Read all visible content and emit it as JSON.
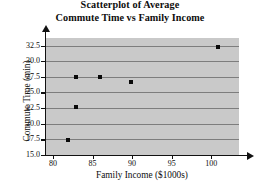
{
  "chart_data": {
    "type": "scatter",
    "title": "Scatterplot of Average Commute Time vs Family Income",
    "title_line1": "Scatterplot of Average",
    "title_line2": "Commute Time vs Family Income",
    "xlabel": "Family Income ($1000s)",
    "ylabel": "Commute Time (min)",
    "xlim": [
      79.0,
      103.5
    ],
    "ylim": [
      15.0,
      33.7
    ],
    "xticks": [
      80,
      85,
      90,
      95,
      100
    ],
    "xtick_labels": [
      "80",
      "85",
      "90",
      "95",
      "100"
    ],
    "yticks": [
      15.0,
      17.5,
      20.0,
      22.5,
      25.0,
      27.5,
      30.0,
      32.5
    ],
    "ytick_labels": [
      "15.0",
      "17.5",
      "20.0",
      "22.5",
      "25.0",
      "27.5",
      "30.0",
      "32.5"
    ],
    "grid": "horizontal",
    "legend": null,
    "panel_color": "#c9c9c9",
    "gridline_color": "#7d7d7d",
    "marker_color": "#0a0a0a",
    "points": [
      {
        "x": 81.9,
        "y": 17.4
      },
      {
        "x": 82.9,
        "y": 22.7
      },
      {
        "x": 82.9,
        "y": 27.4
      },
      {
        "x": 85.9,
        "y": 27.4
      },
      {
        "x": 89.9,
        "y": 26.6
      },
      {
        "x": 100.9,
        "y": 32.2
      }
    ],
    "x": [
      81.9,
      82.9,
      82.9,
      85.9,
      89.9,
      100.9
    ],
    "y": [
      17.4,
      22.7,
      27.4,
      27.4,
      26.6,
      32.2
    ]
  }
}
